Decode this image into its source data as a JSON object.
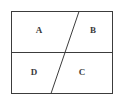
{
  "figure": {
    "background_color": "#ffffff",
    "stroke_color": "#3c3c3c",
    "label_color": "#3a3a3a",
    "rect": {
      "x": 11,
      "y": 11,
      "width": 102,
      "height": 83,
      "stroke_width": 1
    },
    "lines": [
      {
        "name": "horizontal-divider",
        "x1": 11,
        "y1": 52.5,
        "x2": 113,
        "y2": 52.5,
        "stroke_width": 1
      },
      {
        "name": "diagonal-divider",
        "x1": 79,
        "y1": 11,
        "x2": 51,
        "y2": 94,
        "stroke_width": 1
      }
    ],
    "labels": [
      {
        "text": "A",
        "x": 39,
        "y": 30,
        "region": "top-left"
      },
      {
        "text": "B",
        "x": 93,
        "y": 30,
        "region": "top-right"
      },
      {
        "text": "D",
        "x": 34,
        "y": 72,
        "region": "bottom-left"
      },
      {
        "text": "C",
        "x": 82,
        "y": 72,
        "region": "bottom-right"
      }
    ]
  }
}
